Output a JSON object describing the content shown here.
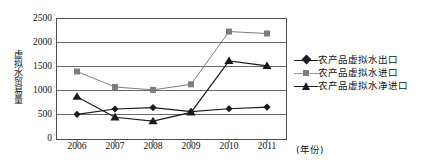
{
  "chart_data": {
    "type": "line",
    "title": "",
    "xlabel": "(年份)",
    "ylabel": "虚拟水贸易量",
    "categories": [
      "2006",
      "2007",
      "2008",
      "2009",
      "2010",
      "2011"
    ],
    "ylim": [
      0,
      2500
    ],
    "yticks": [
      "0",
      "500",
      "1000",
      "1500",
      "2000",
      "2500"
    ],
    "grid": true,
    "legend_position": "right",
    "series": [
      {
        "name": "农产品虚拟水出口",
        "marker": "diamond",
        "color": "#1a1a1a",
        "values": [
          520,
          630,
          660,
          575,
          635,
          670
        ]
      },
      {
        "name": "农产品虚拟水进口",
        "marker": "square",
        "color": "#7d7d7d",
        "values": [
          1405,
          1085,
          1025,
          1140,
          2230,
          2190
        ]
      },
      {
        "name": "农产品虚拟水净进口",
        "marker": "triangle",
        "color": "#1a1a1a",
        "values": [
          885,
          460,
          380,
          560,
          1625,
          1520
        ]
      }
    ]
  },
  "axis": {
    "y_title": "虚拟水贸易量",
    "x_title": "(年份)"
  },
  "legend": {
    "items": [
      {
        "label": "农产品虚拟水出口",
        "marker": "diamond-marker"
      },
      {
        "label": "农产品虚拟水进口",
        "marker": "square-marker"
      },
      {
        "label": "农产品虚拟水净进口",
        "marker": "triangle-marker"
      }
    ]
  },
  "colors": {
    "export_line": "#1a1a1a",
    "import_line": "#7d7d7d",
    "net_import_line": "#1a1a1a",
    "grid": "#6b6b6b",
    "frame": "#4d4d4d"
  }
}
